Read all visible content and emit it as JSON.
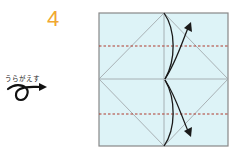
{
  "step": {
    "number": "4",
    "color": "#f0a830"
  },
  "instruction": {
    "flip_label": "うらがえす",
    "icon": "flip-over-arrow-icon"
  },
  "diagram": {
    "paper_color": "#ddf3f7",
    "border_color": "#888888",
    "crease_color": "#9aa0a3",
    "valley_fold_color": "#b03a2e",
    "arrow_color": "#1a1a1a",
    "square": {
      "x": 99,
      "y": 13,
      "w": 129,
      "h": 133
    },
    "dashed_lines_y": [
      46,
      114
    ],
    "arrows": [
      "fold-up-arrow",
      "fold-down-arrow"
    ]
  }
}
